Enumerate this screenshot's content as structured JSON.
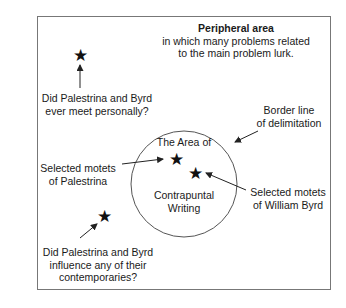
{
  "diagram": {
    "peripheral": {
      "title": "Peripheral area",
      "line1": "in which many problems related",
      "line2": "to the main problem lurk."
    },
    "q1": {
      "line1": "Did Palestrina and Byrd",
      "line2": "ever meet personally?"
    },
    "border": {
      "line1": "Border line",
      "line2": "of delimitation"
    },
    "circle": {
      "top": "The Area of",
      "bottom1": "Contrapuntal",
      "bottom2": "Writing"
    },
    "palestrina": {
      "line1": "Selected motets",
      "line2": "of Palestrina"
    },
    "byrd": {
      "line1": "Selected motets",
      "line2": "of William Byrd"
    },
    "q2": {
      "line1": "Did Palestrina and Byrd",
      "line2": "influence any of their",
      "line3": "contemporaries?"
    },
    "star_glyph": "★"
  }
}
